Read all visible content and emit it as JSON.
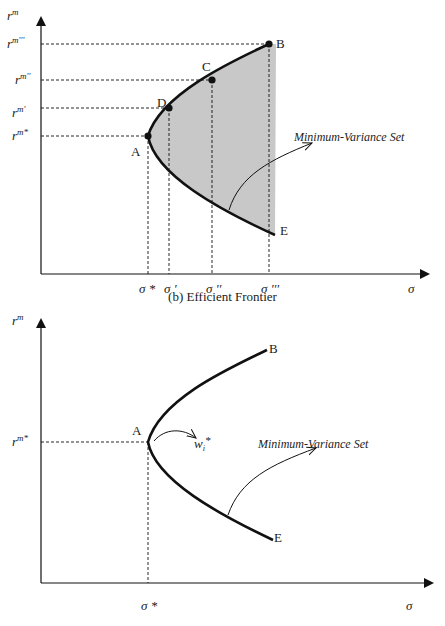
{
  "top_chart": {
    "y_axis_label": "r",
    "y_axis_sup": "m",
    "x_axis_label": "σ",
    "y_ticks": [
      {
        "base": "r",
        "sup": "m'''"
      },
      {
        "base": "r",
        "sup": "m''"
      },
      {
        "base": "r",
        "sup": "m'"
      },
      {
        "base": "r",
        "sup": "m*"
      }
    ],
    "x_ticks": [
      "σ *",
      "σ '",
      "σ ''",
      "σ '''"
    ],
    "points": [
      "A",
      "B",
      "C",
      "D",
      "E"
    ],
    "annotation": "Minimum-Variance Set",
    "caption": "(b) Efficient Frontier",
    "fill_color": "#c8c8c8"
  },
  "bottom_chart": {
    "y_axis_label": "r",
    "y_axis_sup": "m",
    "x_axis_label": "σ",
    "y_ticks": [
      {
        "base": "r",
        "sup": "m*"
      }
    ],
    "x_ticks": [
      "σ *"
    ],
    "points": [
      "A",
      "B",
      "E"
    ],
    "weight_label": "w",
    "weight_sub": "i",
    "weight_sup": "*",
    "annotation": "Minimum-Variance Set"
  }
}
